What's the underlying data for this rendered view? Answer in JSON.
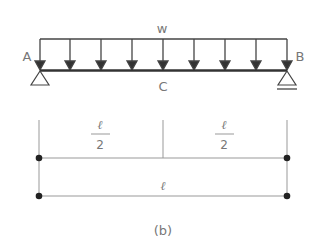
{
  "diagram": {
    "load_label": "w",
    "support_left_label": "A",
    "support_right_label": "B",
    "midpoint_label": "C",
    "half_span_numerator": "ℓ",
    "half_span_denominator": "2",
    "full_span_label": "ℓ",
    "caption": "(b)",
    "load_arrow_count": 9,
    "colors": {
      "line": "#333333",
      "dim_line": "#999999",
      "text": "#777777"
    }
  }
}
